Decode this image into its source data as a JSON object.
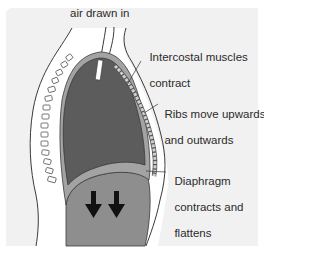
{
  "diagram": {
    "type": "anatomical cross-section",
    "labels": {
      "air": "air drawn in",
      "intercostal_line1": "Intercostal muscles",
      "intercostal_line2": "contract",
      "ribs_line1": "Ribs move upwards",
      "ribs_line2": "and outwards",
      "diaphragm_line1": "Diaphragm",
      "diaphragm_line2": "contracts and",
      "diaphragm_line3": "flattens"
    },
    "arrows": {
      "count": 2,
      "direction": "down"
    },
    "colors": {
      "background": "#f1f1f1",
      "lung": "#5c5c5c",
      "pleura_band": "#a3a3a3",
      "abdomen": "#8e8e8e",
      "body_wall": "#ffffff",
      "outline": "#3a3a3a",
      "arrow": "#111111"
    }
  }
}
